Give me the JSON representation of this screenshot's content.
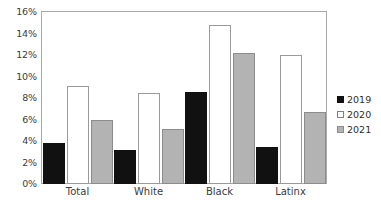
{
  "chart_data": {
    "type": "bar",
    "title": "",
    "subtitle": "",
    "xlabel": "",
    "ylabel": "",
    "categories": [
      "Total",
      "White",
      "Black",
      "Latinx"
    ],
    "series": [
      {
        "name": "2019",
        "color": "#111111",
        "values": [
          3.8,
          3.2,
          8.6,
          3.4
        ]
      },
      {
        "name": "2020",
        "color": "#ffffff",
        "values": [
          9.1,
          8.5,
          14.8,
          12.0
        ]
      },
      {
        "name": "2021",
        "color": "#b3b3b3",
        "values": [
          6.0,
          5.1,
          12.2,
          6.7
        ]
      }
    ],
    "ylim": [
      0,
      16
    ],
    "ytick_step": 2,
    "ytick_labels": [
      "0%",
      "2%",
      "4%",
      "6%",
      "8%",
      "10%",
      "12%",
      "14%",
      "16%"
    ],
    "ytick_values": [
      0,
      2,
      4,
      6,
      8,
      10,
      12,
      14,
      16
    ],
    "grid": false,
    "legend_position": "right",
    "legend_entries": [
      "2019",
      "2020",
      "2021"
    ]
  },
  "colors": {
    "series_2019": "#111111",
    "series_2020": "#ffffff",
    "series_2021": "#b3b3b3",
    "axis": "#a9a9a9",
    "text": "#3b3b3b",
    "background": "#ffffff"
  }
}
